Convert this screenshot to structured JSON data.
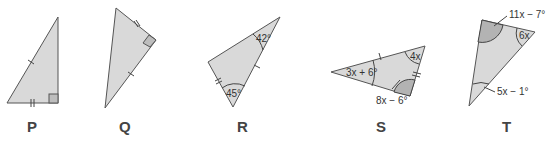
{
  "figures": [
    {
      "id": "P",
      "label": "P",
      "marks": [
        "right-angle",
        "single-tick hypotenuse",
        "double-tick base"
      ]
    },
    {
      "id": "Q",
      "label": "Q",
      "marks": [
        "right-angle",
        "double-tick short leg",
        "single-tick long leg"
      ]
    },
    {
      "id": "R",
      "label": "R",
      "angles": [
        "42°",
        "45°"
      ],
      "marks": [
        "single-tick side",
        "double-tick side"
      ]
    },
    {
      "id": "S",
      "label": "S",
      "angles": [
        "3x + 6°",
        "4x",
        "8x − 6°"
      ],
      "marks": [
        "single-tick side",
        "double-tick side"
      ]
    },
    {
      "id": "T",
      "label": "T",
      "angles": [
        "11x − 7°",
        "6x",
        "5x − 1°"
      ]
    }
  ]
}
